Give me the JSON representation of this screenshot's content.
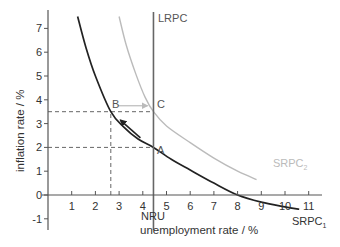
{
  "chart_data": {
    "type": "line",
    "title": "",
    "xlabel": "unemployment rate / %",
    "ylabel": "inflation rate / %",
    "xlim": [
      0,
      11.5
    ],
    "ylim": [
      -1.5,
      7.7
    ],
    "x_ticks": [
      1,
      2,
      3,
      4,
      5,
      6,
      7,
      8,
      9,
      10,
      11
    ],
    "y_ticks": [
      -1,
      0,
      1,
      2,
      3,
      4,
      5,
      6,
      7
    ],
    "grid": false,
    "legend": null,
    "series": [
      {
        "name": "SRPC1",
        "label_main": "SRPC",
        "label_sub": "1",
        "color": "#222222",
        "x": [
          1.25,
          1.6,
          2.0,
          2.65,
          3.2,
          3.8,
          4.45,
          5.2,
          6.0,
          7.0,
          8.0,
          9.0,
          10.0,
          10.6
        ],
        "y": [
          7.5,
          6.2,
          5.0,
          3.5,
          2.85,
          2.35,
          2.0,
          1.5,
          1.05,
          0.5,
          0.0,
          -0.3,
          -0.5,
          -0.6
        ]
      },
      {
        "name": "SRPC2",
        "label_main": "SRPC",
        "label_sub": "2",
        "color": "#bbbbbb",
        "x": [
          3.0,
          3.3,
          3.7,
          4.1,
          4.45,
          5.0,
          6.0,
          7.0,
          8.0,
          8.8
        ],
        "y": [
          7.5,
          6.3,
          5.1,
          4.1,
          3.5,
          2.9,
          2.2,
          1.55,
          1.0,
          0.65
        ]
      },
      {
        "name": "LRPC",
        "label_main": "LRPC",
        "color": "#666666",
        "x": [
          4.45,
          4.45
        ],
        "y": [
          7.8,
          -1.5
        ]
      }
    ],
    "points": [
      {
        "label": "A",
        "x": 4.45,
        "y": 2.0
      },
      {
        "label": "B",
        "x": 2.65,
        "y": 3.5
      },
      {
        "label": "C",
        "x": 4.45,
        "y": 3.5
      }
    ],
    "annotations": [
      {
        "type": "vline-label",
        "text": "NRU",
        "x": 4.45
      },
      {
        "type": "dashed-guide",
        "from": [
          0,
          3.5
        ],
        "to": [
          4.45,
          3.5
        ]
      },
      {
        "type": "dashed-guide",
        "from": [
          0,
          2.0
        ],
        "to": [
          4.45,
          2.0
        ]
      },
      {
        "type": "dashed-guide",
        "from": [
          2.65,
          0
        ],
        "to": [
          2.65,
          3.5
        ]
      },
      {
        "type": "arrow",
        "from": [
          3.9,
          2.4
        ],
        "to": [
          3.05,
          3.15
        ],
        "color": "#222222",
        "meaning": "A to B along SRPC1"
      },
      {
        "type": "arrow",
        "from": [
          2.95,
          3.75
        ],
        "to": [
          4.2,
          3.75
        ],
        "color": "#bbbbbb",
        "meaning": "B to C"
      }
    ]
  },
  "labels": {
    "lrpc": "LRPC",
    "nru": "NRU",
    "srpc": "SRPC",
    "srpc1_sub": "1",
    "srpc2_sub": "2",
    "point_a": "A",
    "point_b": "B",
    "point_c": "C",
    "xlabel": "unemployment rate / %",
    "ylabel": "inflation rate / %",
    "x_ticks": [
      "1",
      "2",
      "3",
      "4",
      "5",
      "6",
      "7",
      "8",
      "9",
      "10",
      "11"
    ],
    "y_ticks": [
      "-1",
      "0",
      "1",
      "2",
      "3",
      "4",
      "5",
      "6",
      "7"
    ]
  }
}
